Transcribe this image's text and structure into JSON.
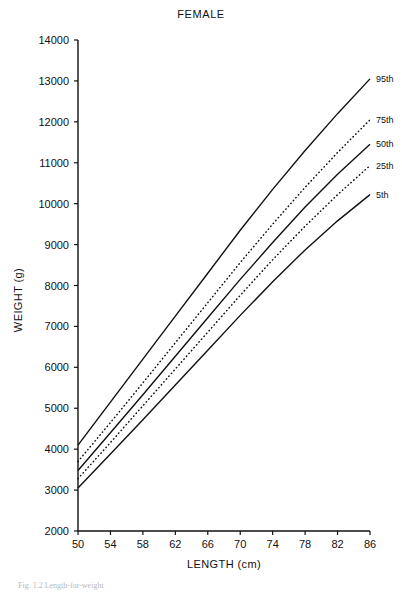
{
  "chart_data": {
    "type": "line",
    "title": "FEMALE",
    "xlabel": "LENGTH (cm)",
    "ylabel": "WEIGHT (g)",
    "xlim": [
      50,
      86
    ],
    "ylim": [
      2000,
      14000
    ],
    "xticks": [
      50,
      54,
      58,
      62,
      66,
      70,
      74,
      78,
      82,
      86
    ],
    "yticks": [
      2000,
      3000,
      4000,
      5000,
      6000,
      7000,
      8000,
      9000,
      10000,
      11000,
      12000,
      13000,
      14000
    ],
    "grid": false,
    "legend_position": "right-inline",
    "series": [
      {
        "name": "95th",
        "label": "95th",
        "style": "solid",
        "x": [
          50,
          54,
          58,
          62,
          66,
          70,
          74,
          78,
          82,
          86
        ],
        "values": [
          4100,
          5150,
          6200,
          7250,
          8300,
          9350,
          10350,
          11300,
          12200,
          13050
        ]
      },
      {
        "name": "75th",
        "label": "75th",
        "style": "dotted",
        "x": [
          50,
          54,
          58,
          62,
          66,
          70,
          74,
          78,
          82,
          86
        ],
        "values": [
          3700,
          4650,
          5620,
          6600,
          7580,
          8560,
          9500,
          10400,
          11250,
          12050
        ]
      },
      {
        "name": "50th",
        "label": "50th",
        "style": "solid",
        "x": [
          50,
          54,
          58,
          62,
          66,
          70,
          74,
          78,
          82,
          86
        ],
        "values": [
          3480,
          4400,
          5330,
          6270,
          7210,
          8150,
          9050,
          9920,
          10720,
          11450
        ]
      },
      {
        "name": "25th",
        "label": "25th",
        "style": "dotted",
        "x": [
          50,
          54,
          58,
          62,
          66,
          70,
          74,
          78,
          82,
          86
        ],
        "values": [
          3280,
          4160,
          5060,
          5960,
          6860,
          7760,
          8630,
          9450,
          10220,
          10930
        ]
      },
      {
        "name": "5th",
        "label": "5th",
        "style": "solid",
        "x": [
          50,
          54,
          58,
          62,
          66,
          70,
          74,
          78,
          82,
          86
        ],
        "values": [
          3050,
          3880,
          4720,
          5570,
          6420,
          7270,
          8090,
          8870,
          9580,
          10220
        ]
      }
    ]
  },
  "caption": {
    "text": "Fig. 1.2  Length-for-weight"
  }
}
